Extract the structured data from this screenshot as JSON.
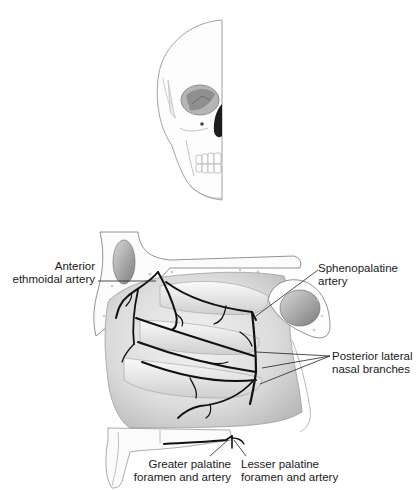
{
  "figure": {
    "inset": "Skull frontal view (half)",
    "labels": {
      "anterior_ethmoidal": {
        "line1": "Anterior",
        "line2": "ethmoidal artery"
      },
      "sphenopalatine": {
        "line1": "Sphenopalatine",
        "line2": "artery"
      },
      "posterior_lateral": {
        "line1": "Posterior lateral",
        "line2": "nasal branches"
      },
      "greater_palatine": {
        "line1": "Greater palatine",
        "line2": "foramen and artery"
      },
      "lesser_palatine": {
        "line1": "Lesser palatine",
        "line2": "foramen and artery"
      }
    },
    "colors": {
      "artery": "#111111",
      "bone_outline": "#6a6a6a",
      "mucosa_shade": "#d9d9d9",
      "label_text": "#1a1a1a"
    }
  }
}
